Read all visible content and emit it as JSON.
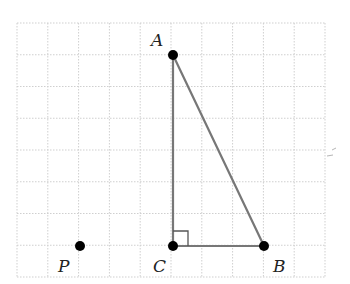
{
  "figure": {
    "grid": {
      "x0": 17,
      "y0": 23,
      "cols": 10,
      "rows": 8,
      "cell_w": 30.8,
      "cell_h": 31.75,
      "line_color": "#cfcfcf"
    },
    "points": [
      {
        "name": "A",
        "label": "A",
        "x": 173,
        "y": 55,
        "label_x": 151,
        "label_y": 46
      },
      {
        "name": "B",
        "label": "B",
        "x": 264,
        "y": 246,
        "label_x": 273,
        "label_y": 272
      },
      {
        "name": "C",
        "label": "C",
        "x": 173,
        "y": 246,
        "label_x": 153,
        "label_y": 272
      },
      {
        "name": "P",
        "label": "P",
        "x": 80,
        "y": 246,
        "label_x": 58,
        "label_y": 272
      }
    ],
    "segments": [
      {
        "from": "A",
        "to": "C"
      },
      {
        "from": "C",
        "to": "B"
      },
      {
        "from": "A",
        "to": "B"
      }
    ],
    "right_angle_marker": {
      "at": "C",
      "size": 15
    },
    "colors": {
      "segment": "#777777",
      "point": "#000000",
      "marker": "#555555"
    }
  }
}
